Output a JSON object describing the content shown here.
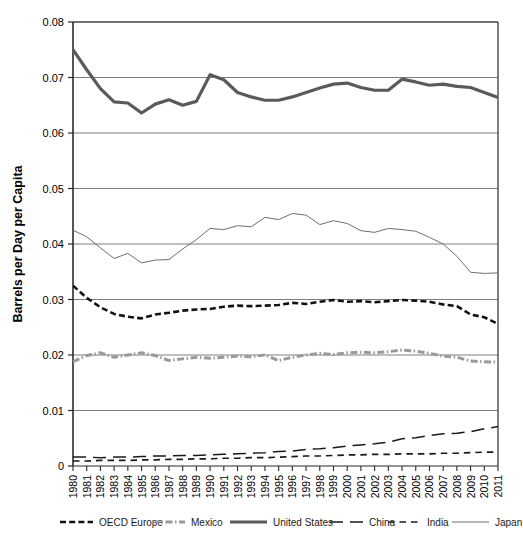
{
  "chart_data": {
    "type": "line",
    "title": "",
    "xlabel": "",
    "ylabel": "Barrels per Day per Capita",
    "xlim": [
      1980,
      2011
    ],
    "ylim": [
      0,
      0.08
    ],
    "grid": "horizontal",
    "legend_position": "bottom",
    "ytick_labels": [
      "0",
      "0.01",
      "0.02",
      "0.03",
      "0.04",
      "0.05",
      "0.06",
      "0.07",
      "0.08"
    ],
    "ytick_values": [
      0,
      0.01,
      0.02,
      0.03,
      0.04,
      0.05,
      0.06,
      0.07,
      0.08
    ],
    "categories": [
      1980,
      1981,
      1982,
      1983,
      1984,
      1985,
      1986,
      1987,
      1988,
      1989,
      1990,
      1991,
      1992,
      1993,
      1994,
      1995,
      1996,
      1997,
      1998,
      1999,
      2000,
      2001,
      2002,
      2003,
      2004,
      2005,
      2006,
      2007,
      2008,
      2009,
      2010,
      2011
    ],
    "xtick_labels": [
      "1980",
      "1981",
      "1982",
      "1983",
      "1984",
      "1985",
      "1986",
      "1987",
      "1988",
      "1989",
      "1990",
      "1991",
      "1992",
      "1993",
      "1994",
      "1995",
      "1996",
      "1997",
      "1998",
      "1999",
      "2000",
      "2001",
      "2002",
      "2003",
      "2004",
      "2005",
      "2006",
      "2007",
      "2008",
      "2009",
      "2010",
      "2011"
    ],
    "series": [
      {
        "name": "OECD Europe",
        "color": "#111111",
        "width": 2.6,
        "dash": "6,3.2",
        "values": [
          0.0325,
          0.0303,
          0.0286,
          0.0274,
          0.0269,
          0.0266,
          0.0273,
          0.0276,
          0.028,
          0.0282,
          0.0283,
          0.0287,
          0.0289,
          0.0288,
          0.0289,
          0.029,
          0.0294,
          0.0292,
          0.0296,
          0.0299,
          0.0296,
          0.0297,
          0.0295,
          0.0297,
          0.0299,
          0.0298,
          0.0296,
          0.0291,
          0.0288,
          0.0273,
          0.0268,
          0.0256
        ]
      },
      {
        "name": "Mexico",
        "color": "#9a9a9a",
        "width": 3.0,
        "dash": "7,2.5,1.5,2.5",
        "values": [
          0.0188,
          0.0199,
          0.0204,
          0.0196,
          0.02,
          0.0204,
          0.0199,
          0.019,
          0.0193,
          0.0196,
          0.0194,
          0.0196,
          0.0198,
          0.0197,
          0.02,
          0.019,
          0.0196,
          0.02,
          0.0203,
          0.0201,
          0.0204,
          0.0205,
          0.0204,
          0.0206,
          0.0209,
          0.0207,
          0.0203,
          0.0198,
          0.0196,
          0.0189,
          0.0188,
          0.0187
        ]
      },
      {
        "name": "United States",
        "color": "#5a5a5a",
        "width": 3.2,
        "dash": "none",
        "values": [
          0.075,
          0.0714,
          0.068,
          0.0656,
          0.0654,
          0.0636,
          0.0652,
          0.066,
          0.065,
          0.0657,
          0.0705,
          0.0696,
          0.0673,
          0.0665,
          0.0659,
          0.0659,
          0.0665,
          0.0673,
          0.0681,
          0.0688,
          0.069,
          0.0682,
          0.0677,
          0.0677,
          0.0697,
          0.0692,
          0.0686,
          0.0688,
          0.0684,
          0.0682,
          0.0673,
          0.0664
        ]
      },
      {
        "name": "China",
        "color": "#1a1a1a",
        "width": 1.5,
        "dash": "13,7",
        "values": [
          0.0016,
          0.0016,
          0.0015,
          0.0016,
          0.0016,
          0.0017,
          0.0018,
          0.0018,
          0.0019,
          0.0019,
          0.002,
          0.0021,
          0.0022,
          0.0023,
          0.0024,
          0.0026,
          0.0027,
          0.003,
          0.0031,
          0.0033,
          0.0036,
          0.0038,
          0.004,
          0.0043,
          0.0049,
          0.0051,
          0.0055,
          0.0058,
          0.0059,
          0.0062,
          0.0067,
          0.0071
        ]
      },
      {
        "name": "India",
        "color": "#1a1a1a",
        "width": 1.7,
        "dash": "6.5,5",
        "values": [
          0.0009,
          0.0009,
          0.001,
          0.001,
          0.001,
          0.0011,
          0.0011,
          0.0012,
          0.0012,
          0.0013,
          0.0013,
          0.0014,
          0.0014,
          0.0015,
          0.0015,
          0.0016,
          0.0017,
          0.0018,
          0.0018,
          0.0019,
          0.002,
          0.002,
          0.0021,
          0.0021,
          0.0022,
          0.0022,
          0.0022,
          0.0023,
          0.0023,
          0.0024,
          0.0025,
          0.0025
        ]
      },
      {
        "name": "Japan",
        "color": "#6e6e6e",
        "width": 1.0,
        "dash": "none",
        "values": [
          0.0425,
          0.0413,
          0.0393,
          0.0374,
          0.0383,
          0.0366,
          0.0371,
          0.0372,
          0.0391,
          0.0408,
          0.0428,
          0.0426,
          0.0433,
          0.0431,
          0.0448,
          0.0444,
          0.0455,
          0.0452,
          0.0435,
          0.0442,
          0.0437,
          0.0424,
          0.0421,
          0.0428,
          0.0426,
          0.0423,
          0.0412,
          0.04,
          0.0378,
          0.0349,
          0.0347,
          0.0348
        ]
      }
    ]
  },
  "legend": {
    "items": [
      {
        "label": "OECD Europe"
      },
      {
        "label": "Mexico"
      },
      {
        "label": "United States"
      },
      {
        "label": "China"
      },
      {
        "label": "India"
      },
      {
        "label": "Japan"
      }
    ]
  }
}
